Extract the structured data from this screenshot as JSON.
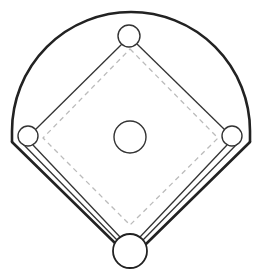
{
  "diagram": {
    "title": "Baseball field diagram",
    "type": "baseball-diamond",
    "colors": {
      "background": "#ffffff",
      "outline": "#222222",
      "basepath": "#333333",
      "dashed": "#bbbbbb",
      "base_fill": "#ffffff"
    },
    "elements": {
      "outfield_fence": "outfield-fence",
      "foul_line_left": "foul-line-left",
      "foul_line_right": "foul-line-right",
      "infield_diamond": "infield-diamond",
      "inner_dashed_diamond": "inner-dashed-diamond",
      "home_plate": "home-plate",
      "first_base": "first-base",
      "second_base": "second-base",
      "third_base": "third-base",
      "pitchers_mound": "pitchers-mound"
    }
  }
}
